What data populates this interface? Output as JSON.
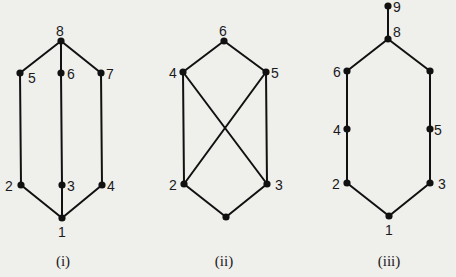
{
  "diagrams": [
    {
      "id": "i",
      "caption": "(i)",
      "caption_pos": [
        63,
        266
      ],
      "nodes": [
        {
          "id": "1",
          "label": "1",
          "x": 62,
          "y": 218,
          "lx": 58,
          "ly": 237
        },
        {
          "id": "2",
          "label": "2",
          "x": 21,
          "y": 185,
          "lx": 5,
          "ly": 191
        },
        {
          "id": "3",
          "label": "3",
          "x": 62,
          "y": 185,
          "lx": 67,
          "ly": 191
        },
        {
          "id": "4",
          "label": "4",
          "x": 102,
          "y": 185,
          "lx": 107,
          "ly": 191
        },
        {
          "id": "5",
          "label": "5",
          "x": 20,
          "y": 73,
          "lx": 28,
          "ly": 83
        },
        {
          "id": "6",
          "label": "6",
          "x": 61,
          "y": 73,
          "lx": 67,
          "ly": 79
        },
        {
          "id": "7",
          "label": "7",
          "x": 101,
          "y": 73,
          "lx": 106,
          "ly": 79
        },
        {
          "id": "8",
          "label": "8",
          "x": 61,
          "y": 41,
          "lx": 56,
          "ly": 36
        }
      ],
      "edges": [
        [
          "8",
          "5"
        ],
        [
          "8",
          "6"
        ],
        [
          "8",
          "7"
        ],
        [
          "5",
          "2"
        ],
        [
          "6",
          "3"
        ],
        [
          "7",
          "4"
        ],
        [
          "2",
          "1"
        ],
        [
          "3",
          "1"
        ],
        [
          "4",
          "1"
        ]
      ]
    },
    {
      "id": "ii",
      "caption": "(ii)",
      "caption_pos": [
        224,
        266
      ],
      "nodes": [
        {
          "id": "1",
          "label": "",
          "x": 226,
          "y": 217,
          "lx": 0,
          "ly": 0
        },
        {
          "id": "2",
          "label": "2",
          "x": 184,
          "y": 184,
          "lx": 169,
          "ly": 190
        },
        {
          "id": "3",
          "label": "3",
          "x": 267,
          "y": 184,
          "lx": 275,
          "ly": 190
        },
        {
          "id": "4",
          "label": "4",
          "x": 183,
          "y": 72,
          "lx": 169,
          "ly": 78
        },
        {
          "id": "5",
          "label": "5",
          "x": 266,
          "y": 72,
          "lx": 271,
          "ly": 78
        },
        {
          "id": "6",
          "label": "6",
          "x": 224,
          "y": 41,
          "lx": 219,
          "ly": 36
        }
      ],
      "edges": [
        [
          "6",
          "4"
        ],
        [
          "6",
          "5"
        ],
        [
          "4",
          "2"
        ],
        [
          "5",
          "3"
        ],
        [
          "4",
          "3"
        ],
        [
          "5",
          "2"
        ],
        [
          "2",
          "1"
        ],
        [
          "3",
          "1"
        ]
      ]
    },
    {
      "id": "iii",
      "caption": "(iii)",
      "caption_pos": [
        389,
        266
      ],
      "nodes": [
        {
          "id": "1",
          "label": "1",
          "x": 389,
          "y": 216,
          "lx": 385,
          "ly": 235
        },
        {
          "id": "2",
          "label": "2",
          "x": 347,
          "y": 183,
          "lx": 332,
          "ly": 189
        },
        {
          "id": "3",
          "label": "3",
          "x": 430,
          "y": 183,
          "lx": 438,
          "ly": 189
        },
        {
          "id": "4",
          "label": "4",
          "x": 347,
          "y": 129,
          "lx": 333,
          "ly": 135
        },
        {
          "id": "5",
          "label": "5",
          "x": 430,
          "y": 129,
          "lx": 434,
          "ly": 135
        },
        {
          "id": "6",
          "label": "6",
          "x": 347,
          "y": 71,
          "lx": 333,
          "ly": 77
        },
        {
          "id": "7",
          "label": "",
          "x": 430,
          "y": 71,
          "lx": 0,
          "ly": 0
        },
        {
          "id": "8",
          "label": "8",
          "x": 388,
          "y": 39,
          "lx": 393,
          "ly": 37
        },
        {
          "id": "9",
          "label": "9",
          "x": 388,
          "y": 6,
          "lx": 393,
          "ly": 12
        }
      ],
      "edges": [
        [
          "9",
          "8"
        ],
        [
          "8",
          "6"
        ],
        [
          "8",
          "7"
        ],
        [
          "6",
          "4"
        ],
        [
          "4",
          "2"
        ],
        [
          "7",
          "5"
        ],
        [
          "5",
          "3"
        ],
        [
          "2",
          "1"
        ],
        [
          "3",
          "1"
        ]
      ]
    }
  ]
}
